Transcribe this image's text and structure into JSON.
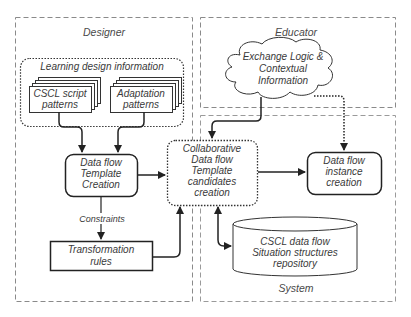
{
  "diagram": {
    "type": "process-flow",
    "colors": {
      "background": "#ffffff",
      "stroke": "#333333",
      "lane_border": "#8a8a8a",
      "text": "#3a3a3a"
    },
    "lanes": {
      "designer": {
        "label": "Designer"
      },
      "educator": {
        "label": "Educator"
      },
      "system": {
        "label": "System"
      }
    },
    "nodes": {
      "learning_design": {
        "label": "Learning design information",
        "shape": "dotted-rounded-group"
      },
      "cscl_script": {
        "line1": "CSCL script",
        "line2": "patterns",
        "shape": "stacked-documents"
      },
      "adaptation": {
        "line1": "Adaptation",
        "line2": "patterns",
        "shape": "stacked-documents"
      },
      "template_creation": {
        "line1": "Data flow",
        "line2": "Template",
        "line3": "Creation",
        "shape": "rounded-rect"
      },
      "transformation_rules": {
        "line1": "Transformation",
        "line2": "rules",
        "shape": "rect"
      },
      "exchange_logic": {
        "line1": "Exchange Logic &",
        "line2": "Contextual",
        "line3": "Information",
        "shape": "cloud"
      },
      "collaborative": {
        "line1": "Collaborative",
        "line2": "Data flow",
        "line3": "Template",
        "line4": "candidates",
        "line5": "creation",
        "shape": "dotted-rounded-rect"
      },
      "instance_creation": {
        "line1": "Data flow",
        "line2": "instance",
        "line3": "creation",
        "shape": "rounded-rect"
      },
      "repository": {
        "line1": "CSCL data flow",
        "line2": "Situation structures",
        "line3": "repository",
        "shape": "cylinder"
      }
    },
    "edges": [
      {
        "from": "cscl_script",
        "to": "template_creation",
        "style": "solid"
      },
      {
        "from": "adaptation",
        "to": "template_creation",
        "style": "solid"
      },
      {
        "from": "template_creation",
        "to": "transformation_rules",
        "style": "solid",
        "label": "Constraints"
      },
      {
        "from": "template_creation",
        "to": "collaborative",
        "style": "solid"
      },
      {
        "from": "transformation_rules",
        "to": "collaborative",
        "style": "solid"
      },
      {
        "from": "exchange_logic",
        "to": "collaborative",
        "style": "solid"
      },
      {
        "from": "exchange_logic",
        "to": "instance_creation",
        "style": "dotted"
      },
      {
        "from": "collaborative",
        "to": "instance_creation",
        "style": "solid"
      },
      {
        "from": "collaborative",
        "to": "repository",
        "style": "solid",
        "bidirectional": true
      }
    ],
    "edge_labels": {
      "constraints": "Constraints"
    }
  }
}
